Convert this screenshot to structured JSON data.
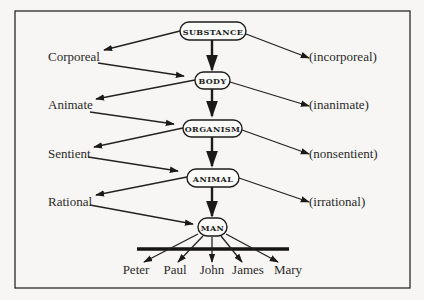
{
  "diagram": {
    "nodes": [
      {
        "id": "substance",
        "label": "SUBSTANCE"
      },
      {
        "id": "body",
        "label": "BODY"
      },
      {
        "id": "organism",
        "label": "ORGANISM"
      },
      {
        "id": "animal",
        "label": "ANIMAL"
      },
      {
        "id": "man",
        "label": "MAN"
      }
    ],
    "left_differentiae": [
      "Corporeal",
      "Animate",
      "Sentient",
      "Rational"
    ],
    "right_differentiae": [
      "(incorporeal)",
      "(inanimate)",
      "(nonsentient)",
      "(irrational)"
    ],
    "individuals": [
      "Peter",
      "Paul",
      "John",
      "James",
      "Mary"
    ],
    "edges": [
      {
        "from": "substance",
        "to": "body",
        "via": "Corporeal"
      },
      {
        "from": "body",
        "to": "organism",
        "via": "Animate"
      },
      {
        "from": "organism",
        "to": "animal",
        "via": "Sentient"
      },
      {
        "from": "animal",
        "to": "man",
        "via": "Rational"
      },
      {
        "from": "substance",
        "to": "(incorporeal)"
      },
      {
        "from": "body",
        "to": "(inanimate)"
      },
      {
        "from": "organism",
        "to": "(nonsentient)"
      },
      {
        "from": "animal",
        "to": "(irrational)"
      },
      {
        "from": "man",
        "to": "Peter"
      },
      {
        "from": "man",
        "to": "Paul"
      },
      {
        "from": "man",
        "to": "John"
      },
      {
        "from": "man",
        "to": "James"
      },
      {
        "from": "man",
        "to": "Mary"
      }
    ]
  }
}
